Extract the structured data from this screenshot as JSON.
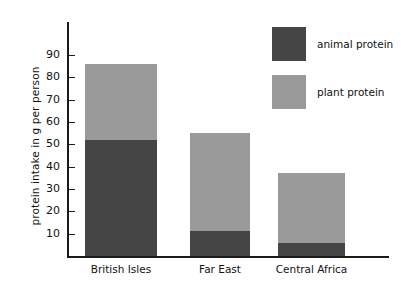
{
  "chart_data": {
    "type": "bar",
    "subtype": "stacked-bar",
    "title": "",
    "xlabel": "",
    "ylabel": "protein intake in g per person",
    "categories": [
      "British Isles",
      "Far East",
      "Central Africa"
    ],
    "series": [
      {
        "name": "animal protein",
        "color": "#454545",
        "values": [
          52,
          11,
          6
        ]
      },
      {
        "name": "plant protein",
        "color": "#9a9a9a",
        "values": [
          34,
          44,
          31
        ]
      }
    ],
    "totals": [
      86,
      55,
      37
    ],
    "ylim": [
      0,
      95
    ],
    "yticks": [
      10,
      20,
      30,
      40,
      50,
      60,
      70,
      80,
      90
    ],
    "ytick_labels": [
      "10",
      "20",
      "30",
      "40",
      "50",
      "60",
      "70",
      "80",
      "90"
    ],
    "grid": false,
    "legend_position": "top-right",
    "legend_entries": [
      "animal protein",
      "plant protein"
    ]
  },
  "axes": {
    "y_title": "protein intake in g per person",
    "ticks": [
      {
        "value": 90,
        "label": "90"
      },
      {
        "value": 80,
        "label": "80"
      },
      {
        "value": 70,
        "label": "70"
      },
      {
        "value": 60,
        "label": "60"
      },
      {
        "value": 50,
        "label": "50"
      },
      {
        "value": 40,
        "label": "40"
      },
      {
        "value": 30,
        "label": "30"
      },
      {
        "value": 20,
        "label": "20"
      },
      {
        "value": 10,
        "label": "10"
      }
    ]
  },
  "legend": {
    "items": [
      {
        "label": "animal protein",
        "color": "#454545"
      },
      {
        "label": "plant protein",
        "color": "#9a9a9a"
      }
    ]
  },
  "categories": [
    {
      "label": "British Isles",
      "animal": 52,
      "plant": 34
    },
    {
      "label": "Far East",
      "animal": 11,
      "plant": 44
    },
    {
      "label": "Central Africa",
      "animal": 6,
      "plant": 31
    }
  ],
  "colors": {
    "animal": "#454545",
    "plant": "#9a9a9a",
    "axis": "#1b1b1b",
    "background": "#ffffff"
  }
}
